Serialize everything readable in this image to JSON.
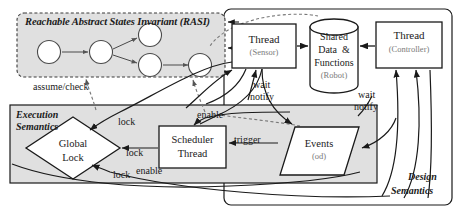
{
  "figure": {
    "type": "architecture-diagram",
    "title_not_shown": "",
    "containers": [
      {
        "id": "rasi",
        "label": "Reachable Abstract States Invariant (RASI)",
        "style": "dashed-rounded",
        "fill": "#e0e0e0"
      },
      {
        "id": "execution_semantics",
        "label_line1": "Execution",
        "label_line2": "Semantics",
        "style": "solid-rect",
        "fill": "#e0e0e0"
      },
      {
        "id": "design_semantics",
        "label_line1": "Design",
        "label_line2": "Semantics",
        "style": "solid-rounded",
        "fill": "#ffffff"
      }
    ],
    "nodes": [
      {
        "id": "thread_sensor",
        "shape": "rect",
        "label": "Thread",
        "sublabel": "(Sensor)"
      },
      {
        "id": "shared_data",
        "shape": "cylinder",
        "label_line1": "Shared",
        "label_line2": "Data  &",
        "label_line3": "Functions",
        "sublabel": "(Robot)"
      },
      {
        "id": "thread_controller",
        "shape": "rect",
        "label": "Thread",
        "sublabel": "(Controller)"
      },
      {
        "id": "global_lock",
        "shape": "diamond",
        "label_line1": "Global",
        "label_line2": "Lock"
      },
      {
        "id": "scheduler_thread",
        "shape": "rect",
        "label_line1": "Scheduler",
        "label_line2": "Thread"
      },
      {
        "id": "events",
        "shape": "parallelogram",
        "label": "Events",
        "sublabel": "(od)"
      }
    ],
    "state_graph": {
      "node_count": 5,
      "edges": 4,
      "shape": "circle"
    },
    "edge_labels": [
      {
        "id": "assume_check",
        "text": "assume/check"
      },
      {
        "id": "wait_notify_sensor_1",
        "text": "wait"
      },
      {
        "id": "wait_notify_sensor_2",
        "text": "notify"
      },
      {
        "id": "wait_notify_ctrl_1",
        "text": "wait"
      },
      {
        "id": "wait_notify_ctrl_2",
        "text": "notify"
      },
      {
        "id": "lock_top",
        "text": "lock"
      },
      {
        "id": "lock_mid",
        "text": "lock"
      },
      {
        "id": "lock_bottom",
        "text": "lock"
      },
      {
        "id": "enable_top",
        "text": "enable"
      },
      {
        "id": "enable_bottom",
        "text": "enable"
      },
      {
        "id": "trigger",
        "text": "trigger"
      }
    ],
    "colors": {
      "container_fill": "#e0e0e0",
      "node_fill": "#ffffff",
      "stroke": "#1a1a1a",
      "sublabel": "#7a7a7a"
    }
  }
}
